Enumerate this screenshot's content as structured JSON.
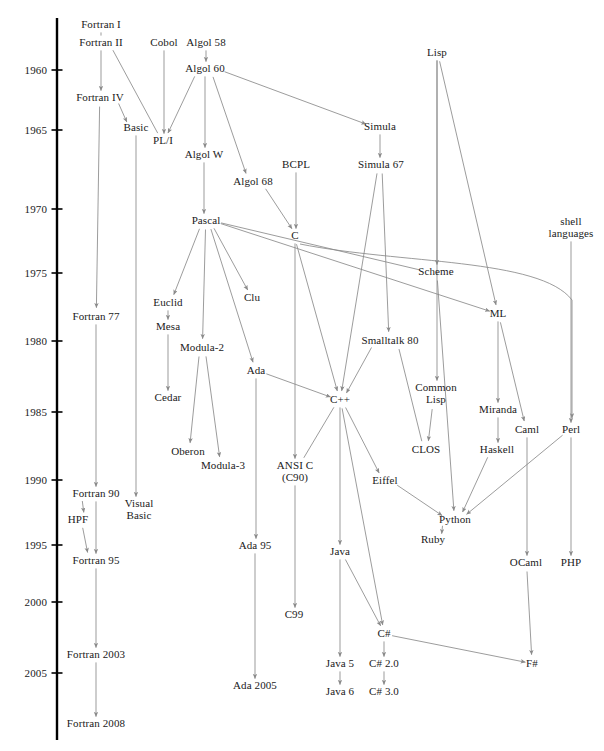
{
  "diagram": {
    "type": "timeline-tree",
    "width": 604,
    "height": 751,
    "background": "#ffffff",
    "edge_color": "#8a8a8a",
    "axis_color": "#000000",
    "text_color": "#1a1a1a"
  },
  "timeline": {
    "axis_x": 57,
    "axis_top": 18,
    "axis_bottom": 740,
    "label_x": 47,
    "tick_length": 11,
    "ticks": [
      {
        "year": "1960",
        "y": 70
      },
      {
        "year": "1965",
        "y": 130
      },
      {
        "year": "1970",
        "y": 209
      },
      {
        "year": "1975",
        "y": 273
      },
      {
        "year": "1980",
        "y": 341
      },
      {
        "year": "1985",
        "y": 412
      },
      {
        "year": "1990",
        "y": 480
      },
      {
        "year": "1995",
        "y": 545
      },
      {
        "year": "2000",
        "y": 602
      },
      {
        "year": "2005",
        "y": 673
      }
    ]
  },
  "nodes": [
    {
      "id": "fortran1",
      "label": "Fortran I",
      "x": 101,
      "y": 25
    },
    {
      "id": "fortran2",
      "label": "Fortran II",
      "x": 101,
      "y": 43
    },
    {
      "id": "cobol",
      "label": "Cobol",
      "x": 164,
      "y": 43
    },
    {
      "id": "algol58",
      "label": "Algol 58",
      "x": 206,
      "y": 43
    },
    {
      "id": "algol60",
      "label": "Algol 60",
      "x": 205,
      "y": 69
    },
    {
      "id": "fortran4",
      "label": "Fortran IV",
      "x": 100,
      "y": 98
    },
    {
      "id": "basic",
      "label": "Basic",
      "x": 136,
      "y": 128
    },
    {
      "id": "pli",
      "label": "PL/I",
      "x": 163,
      "y": 141
    },
    {
      "id": "simula",
      "label": "Simula",
      "x": 380,
      "y": 127
    },
    {
      "id": "algolw",
      "label": "Algol W",
      "x": 204,
      "y": 155
    },
    {
      "id": "bcpl",
      "label": "BCPL",
      "x": 296,
      "y": 165
    },
    {
      "id": "simula67",
      "label": "Simula 67",
      "x": 381,
      "y": 165
    },
    {
      "id": "algol68",
      "label": "Algol 68",
      "x": 253,
      "y": 182
    },
    {
      "id": "pascal",
      "label": "Pascal",
      "x": 206,
      "y": 221
    },
    {
      "id": "c",
      "label": "C",
      "x": 295,
      "y": 236
    },
    {
      "id": "shell",
      "label": "shell\nlanguages",
      "x": 571,
      "y": 228
    },
    {
      "id": "scheme",
      "label": "Scheme",
      "x": 436,
      "y": 272
    },
    {
      "id": "euclid",
      "label": "Euclid",
      "x": 168,
      "y": 303
    },
    {
      "id": "clu",
      "label": "Clu",
      "x": 252,
      "y": 298
    },
    {
      "id": "ml",
      "label": "ML",
      "x": 498,
      "y": 314
    },
    {
      "id": "fortran77",
      "label": "Fortran 77",
      "x": 96,
      "y": 317
    },
    {
      "id": "mesa",
      "label": "Mesa",
      "x": 168,
      "y": 327
    },
    {
      "id": "modula2",
      "label": "Modula-2",
      "x": 202,
      "y": 348
    },
    {
      "id": "smalltalk80",
      "label": "Smalltalk 80",
      "x": 390,
      "y": 341
    },
    {
      "id": "ada",
      "label": "Ada",
      "x": 256,
      "y": 371
    },
    {
      "id": "cedar",
      "label": "Cedar",
      "x": 168,
      "y": 398
    },
    {
      "id": "cpp",
      "label": "C++",
      "x": 340,
      "y": 400
    },
    {
      "id": "commonlisp",
      "label": "Common\nLisp",
      "x": 436,
      "y": 394
    },
    {
      "id": "miranda",
      "label": "Miranda",
      "x": 498,
      "y": 410
    },
    {
      "id": "caml",
      "label": "Caml",
      "x": 527,
      "y": 430
    },
    {
      "id": "perl",
      "label": "Perl",
      "x": 571,
      "y": 430
    },
    {
      "id": "clos",
      "label": "CLOS",
      "x": 426,
      "y": 450
    },
    {
      "id": "haskell",
      "label": "Haskell",
      "x": 497,
      "y": 450
    },
    {
      "id": "oberon",
      "label": "Oberon",
      "x": 188,
      "y": 452
    },
    {
      "id": "modula3",
      "label": "Modula-3",
      "x": 223,
      "y": 466
    },
    {
      "id": "ansic",
      "label": "ANSI C\n(C90)",
      "x": 295,
      "y": 472
    },
    {
      "id": "eiffel",
      "label": "Eiffel",
      "x": 385,
      "y": 481
    },
    {
      "id": "fortran90",
      "label": "Fortran 90",
      "x": 96,
      "y": 494
    },
    {
      "id": "visualbasic",
      "label": "Visual\nBasic",
      "x": 139,
      "y": 510
    },
    {
      "id": "hpf",
      "label": "HPF",
      "x": 78,
      "y": 520
    },
    {
      "id": "python",
      "label": "Python",
      "x": 455,
      "y": 520
    },
    {
      "id": "ruby",
      "label": "Ruby",
      "x": 433,
      "y": 540
    },
    {
      "id": "ada95",
      "label": "Ada 95",
      "x": 255,
      "y": 546
    },
    {
      "id": "java",
      "label": "Java",
      "x": 340,
      "y": 552
    },
    {
      "id": "fortran95",
      "label": "Fortran 95",
      "x": 96,
      "y": 561
    },
    {
      "id": "ocaml",
      "label": "OCaml",
      "x": 526,
      "y": 563
    },
    {
      "id": "php",
      "label": "PHP",
      "x": 571,
      "y": 563
    },
    {
      "id": "c99",
      "label": "C99",
      "x": 294,
      "y": 615
    },
    {
      "id": "csharp",
      "label": "C#",
      "x": 384,
      "y": 634
    },
    {
      "id": "fortran2003",
      "label": "Fortran 2003",
      "x": 96,
      "y": 655
    },
    {
      "id": "java5",
      "label": "Java 5",
      "x": 340,
      "y": 664
    },
    {
      "id": "ada2005",
      "label": "Ada 2005",
      "x": 255,
      "y": 686
    },
    {
      "id": "csharp20",
      "label": "C# 2.0",
      "x": 384,
      "y": 664
    },
    {
      "id": "fsharp",
      "label": "F#",
      "x": 532,
      "y": 664
    },
    {
      "id": "java6",
      "label": "Java 6",
      "x": 340,
      "y": 692
    },
    {
      "id": "csharp30",
      "label": "C# 3.0",
      "x": 384,
      "y": 692
    },
    {
      "id": "fortran2008",
      "label": "Fortran 2008",
      "x": 96,
      "y": 724
    }
  ],
  "edges": [
    {
      "from": "fortran1",
      "to": "fortran2",
      "arrow": false
    },
    {
      "from": "fortran2",
      "to": "fortran4",
      "arrow": true
    },
    {
      "from": "fortran2",
      "to": "pli",
      "arrow": false
    },
    {
      "from": "cobol",
      "to": "pli",
      "arrow": true
    },
    {
      "from": "algol58",
      "to": "algol60",
      "arrow": true
    },
    {
      "from": "algol60",
      "to": "pli",
      "arrow": true
    },
    {
      "from": "algol60",
      "to": "algolw",
      "arrow": true
    },
    {
      "from": "algol60",
      "to": "algol68",
      "arrow": true
    },
    {
      "from": "algol60",
      "to": "simula",
      "arrow": true
    },
    {
      "from": "fortran4",
      "to": "basic",
      "arrow": true
    },
    {
      "from": "fortran4",
      "to": "fortran77",
      "arrow": true
    },
    {
      "from": "basic",
      "to": "visualbasic",
      "arrow": true
    },
    {
      "from": "simula",
      "to": "simula67",
      "arrow": true
    },
    {
      "from": "algolw",
      "to": "pascal",
      "arrow": true
    },
    {
      "from": "bcpl",
      "to": "c",
      "arrow": true
    },
    {
      "from": "algol68",
      "to": "c",
      "arrow": true
    },
    {
      "from": "simula67",
      "to": "cpp",
      "arrow": true
    },
    {
      "from": "simula67",
      "to": "smalltalk80",
      "arrow": true
    },
    {
      "from": "pascal",
      "to": "euclid",
      "arrow": true
    },
    {
      "from": "pascal",
      "to": "clu",
      "arrow": true
    },
    {
      "from": "pascal",
      "to": "modula2",
      "arrow": true
    },
    {
      "from": "pascal",
      "to": "ada",
      "arrow": true
    },
    {
      "from": "pascal",
      "to": "scheme",
      "arrow": false
    },
    {
      "from": "pascal",
      "to": "ml",
      "arrow": true
    },
    {
      "from": "c",
      "to": "cpp",
      "arrow": true
    },
    {
      "from": "c",
      "to": "ansic",
      "arrow": true
    },
    {
      "from": "c",
      "to": "perl",
      "arrow": true
    },
    {
      "from": "lisp",
      "to": "scheme",
      "arrow": true
    },
    {
      "from": "lisp",
      "to": "commonlisp",
      "arrow": true
    },
    {
      "from": "lisp",
      "to": "ml",
      "arrow": true
    },
    {
      "from": "scheme",
      "to": "python",
      "arrow": true
    },
    {
      "from": "euclid",
      "to": "mesa",
      "arrow": true
    },
    {
      "from": "mesa",
      "to": "cedar",
      "arrow": true
    },
    {
      "from": "modula2",
      "to": "oberon",
      "arrow": true
    },
    {
      "from": "modula2",
      "to": "modula3",
      "arrow": true
    },
    {
      "from": "ml",
      "to": "miranda",
      "arrow": true
    },
    {
      "from": "ml",
      "to": "caml",
      "arrow": true
    },
    {
      "from": "miranda",
      "to": "haskell",
      "arrow": true
    },
    {
      "from": "haskell",
      "to": "python",
      "arrow": true
    },
    {
      "from": "caml",
      "to": "ocaml",
      "arrow": true
    },
    {
      "from": "perl",
      "to": "php",
      "arrow": true
    },
    {
      "from": "perl",
      "to": "python",
      "arrow": true
    },
    {
      "from": "shell",
      "to": "perl",
      "arrow": true
    },
    {
      "from": "smalltalk80",
      "to": "cpp",
      "arrow": true
    },
    {
      "from": "smalltalk80",
      "to": "clos",
      "arrow": false
    },
    {
      "from": "commonlisp",
      "to": "clos",
      "arrow": true
    },
    {
      "from": "ada",
      "to": "cpp",
      "arrow": true
    },
    {
      "from": "ada",
      "to": "ada95",
      "arrow": true
    },
    {
      "from": "ada95",
      "to": "ada2005",
      "arrow": true
    },
    {
      "from": "cpp",
      "to": "ansic",
      "arrow": false
    },
    {
      "from": "cpp",
      "to": "java",
      "arrow": true
    },
    {
      "from": "cpp",
      "to": "eiffel",
      "arrow": true
    },
    {
      "from": "cpp",
      "to": "csharp",
      "arrow": true
    },
    {
      "from": "ansic",
      "to": "c99",
      "arrow": true
    },
    {
      "from": "eiffel",
      "to": "python",
      "arrow": true
    },
    {
      "from": "fortran77",
      "to": "fortran90",
      "arrow": true
    },
    {
      "from": "fortran90",
      "to": "hpf",
      "arrow": true
    },
    {
      "from": "fortran90",
      "to": "fortran95",
      "arrow": true
    },
    {
      "from": "hpf",
      "to": "fortran95",
      "arrow": true
    },
    {
      "from": "fortran95",
      "to": "fortran2003",
      "arrow": true
    },
    {
      "from": "fortran2003",
      "to": "fortran2008",
      "arrow": true
    },
    {
      "from": "python",
      "to": "ruby",
      "arrow": true
    },
    {
      "from": "java",
      "to": "java5",
      "arrow": true
    },
    {
      "from": "java",
      "to": "csharp",
      "arrow": true
    },
    {
      "from": "java5",
      "to": "java6",
      "arrow": true
    },
    {
      "from": "csharp",
      "to": "csharp20",
      "arrow": true
    },
    {
      "from": "csharp",
      "to": "fsharp",
      "arrow": true
    },
    {
      "from": "csharp20",
      "to": "csharp30",
      "arrow": true
    },
    {
      "from": "ocaml",
      "to": "fsharp",
      "arrow": true
    }
  ],
  "lisp_node": {
    "id": "lisp",
    "label": "Lisp",
    "x": 437,
    "y": 53
  }
}
